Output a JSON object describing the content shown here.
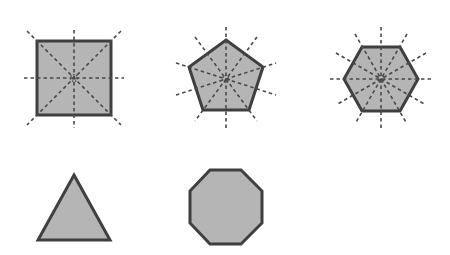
{
  "diagram": {
    "colors": {
      "fill": "#b5b5b5",
      "stroke": "#3f3f3f",
      "symmetry_line": "#4a4a4a",
      "background": "#ffffff"
    },
    "shapes": [
      {
        "name": "square",
        "sides": 4,
        "lines_of_symmetry_shown": 4,
        "center": [
          74,
          78
        ],
        "points": "37,41 111,41 111,115 37,115",
        "axes": [
          [
            74,
            30,
            74,
            128
          ],
          [
            24,
            78,
            124,
            78
          ],
          [
            27,
            31,
            121,
            125
          ],
          [
            121,
            31,
            27,
            125
          ]
        ]
      },
      {
        "name": "pentagon",
        "sides": 5,
        "lines_of_symmetry_shown": 5,
        "center": [
          226,
          79
        ],
        "points": "226,40 263,67 249,110 203,110 189,67",
        "axes": [
          [
            226,
            27,
            226,
            131
          ],
          [
            176,
            63,
            276,
            95
          ],
          [
            176,
            95,
            276,
            63
          ],
          [
            195,
            37,
            257,
            121
          ],
          [
            257,
            37,
            195,
            121
          ]
        ]
      },
      {
        "name": "hexagon",
        "sides": 6,
        "lines_of_symmetry_shown": 6,
        "center": [
          381,
          79
        ],
        "points": "362,47 400,47 418,79 400,111 362,111 344,79",
        "axes": [
          [
            381,
            27,
            381,
            131
          ],
          [
            330,
            79,
            432,
            79
          ],
          [
            355,
            34,
            407,
            124
          ],
          [
            407,
            34,
            355,
            124
          ],
          [
            336,
            53,
            426,
            105
          ],
          [
            426,
            53,
            336,
            105
          ]
        ]
      },
      {
        "name": "triangle",
        "sides": 3,
        "lines_of_symmetry_shown": 0,
        "points": "74,175 110,240 38,240"
      },
      {
        "name": "octagon",
        "sides": 8,
        "lines_of_symmetry_shown": 0,
        "points": "210,170 241,170 262,191 262,223 241,244 210,244 190,223 190,191"
      }
    ]
  }
}
